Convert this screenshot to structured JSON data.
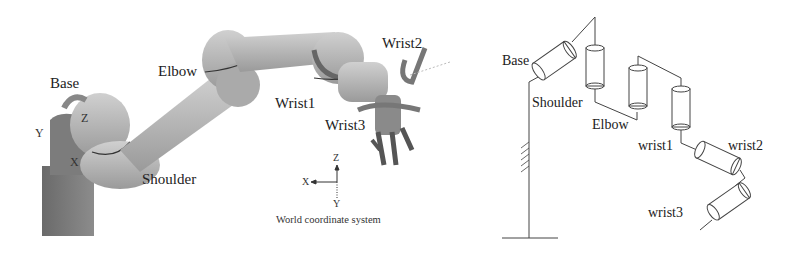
{
  "left_panel": {
    "title": "3D robot arm model",
    "labels": {
      "base": "Base",
      "elbow": "Elbow",
      "shoulder": "Shoulder",
      "wrist1": "Wrist1",
      "wrist2": "Wrist2",
      "wrist3": "Wrist3",
      "axis_x": "X",
      "axis_y": "Y",
      "axis_z": "Z"
    },
    "world_frame": {
      "caption": "World coordinate system",
      "x": "X",
      "y": "Y",
      "z": "Z"
    }
  },
  "right_panel": {
    "title": "Kinematic schematic",
    "labels": {
      "base": "Base",
      "shoulder": "Shoulder",
      "elbow": "Elbow",
      "wrist1": "wrist1",
      "wrist2": "wrist2",
      "wrist3": "wrist3"
    }
  },
  "colors": {
    "arm_body": "#b8b8b8",
    "arm_dark": "#7a7a7a",
    "base_block": "#6e6e6e",
    "line": "#444444"
  }
}
